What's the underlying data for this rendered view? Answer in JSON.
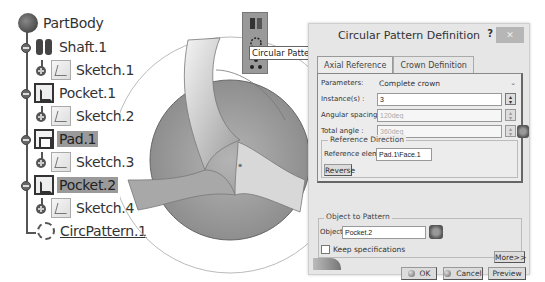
{
  "tree": {
    "items": [
      {
        "label": "PartBody",
        "icon": "partbody-icon",
        "selected": false
      },
      {
        "label": "Shaft.1",
        "icon": "shaft-icon",
        "selected": false
      },
      {
        "label": "Sketch.1",
        "icon": "sketch-icon",
        "selected": false
      },
      {
        "label": "Pocket.1",
        "icon": "pocket-icon",
        "selected": false
      },
      {
        "label": "Sketch.2",
        "icon": "sketch-icon",
        "selected": false
      },
      {
        "label": "Pad.1",
        "icon": "pad-icon",
        "selected": true
      },
      {
        "label": "Sketch.3",
        "icon": "sketch-icon",
        "selected": false
      },
      {
        "label": "Pocket.2",
        "icon": "pocket-icon",
        "selected": true
      },
      {
        "label": "Sketch.4",
        "icon": "sketch-icon",
        "selected": false
      },
      {
        "label": "CircPattern.1",
        "icon": "circular-pattern-icon",
        "selected": false
      }
    ]
  },
  "toolbar": {
    "tooltip": "Circular Pattern"
  },
  "dialog": {
    "title": "Circular Pattern Definition",
    "help": "?",
    "close": "✕",
    "tabs": [
      {
        "label": "Axial Reference",
        "active": true
      },
      {
        "label": "Crown Definition",
        "active": false
      }
    ],
    "parameters_label": "Parameters:",
    "parameters_value": "Complete crown",
    "instances_label": "Instance(s) :",
    "instances_value": "3",
    "angular_spacing_label": "Angular spacing :",
    "angular_spacing_value": "120deg",
    "total_angle_label": "Total angle :",
    "total_angle_value": "360deg",
    "reference_direction_title": "Reference Direction",
    "reference_element_label": "Reference element:",
    "reference_element_value": "Pad.1\\Face.1",
    "reverse_label": "Reverse",
    "object_to_pattern_title": "Object to Pattern",
    "object_label": "Object:",
    "object_value": "Pocket.2",
    "keep_specifications_label": "Keep specifications",
    "keep_specifications_checked": false,
    "more_label": "More>>",
    "ok_label": "OK",
    "cancel_label": "Cancel",
    "preview_label": "Preview"
  }
}
